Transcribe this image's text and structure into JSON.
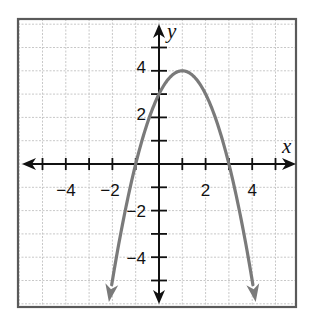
{
  "chart_data": {
    "type": "line",
    "title": "",
    "xlabel": "x",
    "ylabel": "y",
    "function": "y = -x^2 + 2x + 3",
    "vertex": [
      1,
      4
    ],
    "y_intercept": [
      0,
      3
    ],
    "x_intercepts": [
      [
        -1,
        0
      ],
      [
        3,
        0
      ]
    ],
    "xlim": [
      -6,
      6
    ],
    "ylim": [
      -6,
      6
    ],
    "grid": true,
    "x_tick_labels": [
      "-4",
      "-2",
      "2",
      "4"
    ],
    "y_tick_labels": [
      "4",
      "2",
      "-2",
      "-4"
    ],
    "x_ticks": [
      -5,
      -4,
      -3,
      -2,
      -1,
      1,
      2,
      3,
      4,
      5
    ],
    "y_ticks": [
      -5,
      -4,
      -3,
      -2,
      -1,
      1,
      2,
      3,
      4,
      5
    ],
    "series": [
      {
        "name": "parabola",
        "x": [
          -2.15,
          -2,
          -1,
          0,
          1,
          2,
          3,
          4,
          4.15
        ],
        "y": [
          -5.92,
          -5,
          0,
          3,
          4,
          3,
          0,
          -5,
          -5.92
        ],
        "arrows_at_ends": true
      }
    ],
    "legend": null
  },
  "labels": {
    "x_axis": "x",
    "y_axis": "y",
    "x_neg4": "−4",
    "x_neg2": "−2",
    "x_2": "2",
    "x_4": "4",
    "y_4": "4",
    "y_2": "2",
    "y_neg2": "−2",
    "y_neg4": "−4"
  },
  "colors": {
    "curve": "#7a7a7a",
    "axes": "#111111",
    "grid": "#c8c8c8",
    "frame": "#5a5a5a"
  }
}
